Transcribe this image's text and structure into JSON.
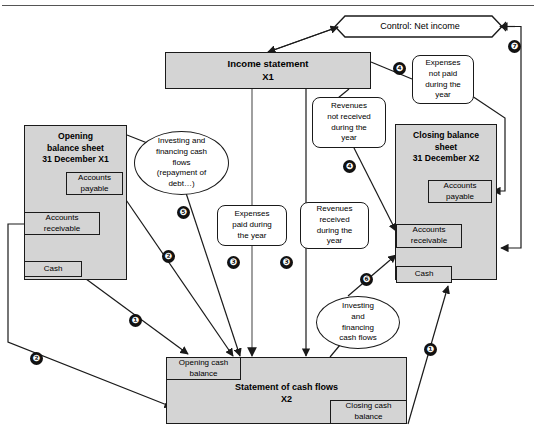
{
  "figure": {
    "type": "flow-diagram",
    "title_rule": true,
    "background": "#ffffff",
    "fill_gray": "#d4d4d4",
    "stroke": "#1a1a1a"
  },
  "nodes": {
    "control": {
      "label": "Control: Net income",
      "shape": "hexagon"
    },
    "income_statement": {
      "label_line1": "Income statement",
      "label_line2": "X1",
      "shape": "rect"
    },
    "opening_bs": {
      "label_line1": "Opening",
      "label_line2": "balance sheet",
      "label_line3": "31 December X1",
      "shape": "rect"
    },
    "opening_ap": {
      "label": "Accounts payable",
      "line1": "Accounts",
      "line2": "payable"
    },
    "opening_ar": {
      "label": "Accounts receivable",
      "line1": "Accounts",
      "line2": "receivable"
    },
    "opening_cash": {
      "label": "Cash"
    },
    "closing_bs": {
      "label_line1": "Closing balance",
      "label_line2": "sheet",
      "label_line3": "31 December X2",
      "shape": "rect"
    },
    "closing_ap": {
      "line1": "Accounts",
      "line2": "payable"
    },
    "closing_ar": {
      "line1": "Accounts",
      "line2": "receivable"
    },
    "closing_cash": {
      "label": "Cash"
    },
    "scf": {
      "label_line1": "Statement of cash flows",
      "label_line2": "X2",
      "shape": "rect"
    },
    "opening_cash_balance": {
      "line1": "Opening cash",
      "line2": "balance"
    },
    "closing_cash_balance": {
      "line1": "Closing cash",
      "line2": "balance"
    },
    "expenses_not_paid": {
      "line1": "Expenses",
      "line2": "not paid",
      "line3": "during the",
      "line4": "year",
      "shape": "rounded"
    },
    "revenues_not_received": {
      "line1": "Revenues",
      "line2": "not received",
      "line3": "during the",
      "line4": "year",
      "shape": "rounded"
    },
    "expenses_paid": {
      "line1": "Expenses",
      "line2": "paid during",
      "line3": "the year",
      "shape": "rounded"
    },
    "revenues_received": {
      "line1": "Revenues",
      "line2": "received",
      "line3": "during the",
      "line4": "year",
      "shape": "rounded"
    },
    "inv_fin_left": {
      "line1": "Investing and",
      "line2": "financing cash",
      "line3": "flows",
      "line4": "(repayment of",
      "line5": "debt…)",
      "shape": "ellipse"
    },
    "inv_fin_right": {
      "line1": "Investing",
      "line2": "and",
      "line3": "financing",
      "line4": "cash flows",
      "shape": "ellipse"
    }
  },
  "markers": [
    {
      "id": "m1a",
      "number": "❶",
      "x": 129,
      "y": 314
    },
    {
      "id": "m2a",
      "number": "❷",
      "x": 162,
      "y": 250
    },
    {
      "id": "m2b",
      "number": "❷",
      "x": 30,
      "y": 352
    },
    {
      "id": "m3a",
      "number": "❸",
      "x": 227,
      "y": 256
    },
    {
      "id": "m3b",
      "number": "❸",
      "x": 280,
      "y": 256
    },
    {
      "id": "m4a",
      "number": "❹",
      "x": 393,
      "y": 62
    },
    {
      "id": "m4b",
      "number": "❹",
      "x": 343,
      "y": 160
    },
    {
      "id": "m5",
      "number": "❺",
      "x": 177,
      "y": 206
    },
    {
      "id": "m6",
      "number": "❻",
      "x": 360,
      "y": 273
    },
    {
      "id": "m7",
      "number": "❼",
      "x": 508,
      "y": 40
    },
    {
      "id": "m1b",
      "number": "❶",
      "x": 424,
      "y": 343
    }
  ]
}
